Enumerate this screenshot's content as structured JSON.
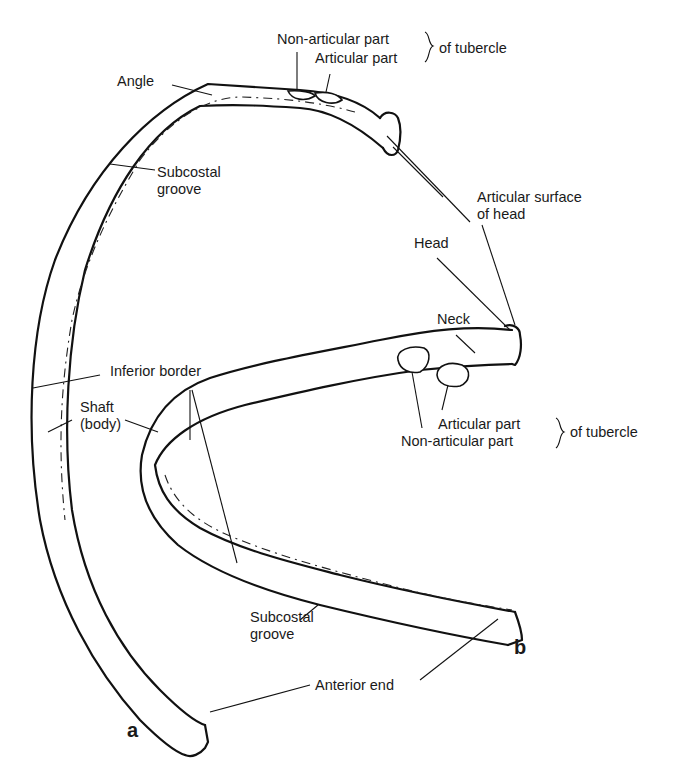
{
  "figure": {
    "panels": [
      {
        "id": "a",
        "label": "a"
      },
      {
        "id": "b",
        "label": "b"
      }
    ],
    "labels": {
      "angle": "Angle",
      "subcostal_groove_a_line1": "Subcostal",
      "subcostal_groove_a_line2": "groove",
      "non_articular_part_top": "Non-articular part",
      "articular_part_top": "Articular part",
      "of_tubercle_top": "of tubercle",
      "articular_surface_line1": "Articular surface",
      "articular_surface_line2": "of head",
      "head": "Head",
      "neck": "Neck",
      "inferior_border": "Inferior border",
      "shaft_line1": "Shaft",
      "shaft_line2": "(body)",
      "articular_part_bottom": "Articular part",
      "non_articular_part_bottom": "Non-articular part",
      "of_tubercle_bottom": "of tubercle",
      "subcostal_groove_b_line1": "Subcostal",
      "subcostal_groove_b_line2": "groove",
      "anterior_end": "Anterior end"
    }
  }
}
